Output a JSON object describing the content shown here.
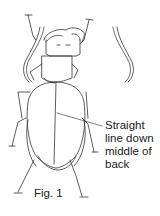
{
  "figure": {
    "caption": "Fig. 1",
    "annotation": {
      "lines": [
        "Straight",
        "line down",
        "middle of",
        "back"
      ],
      "pointer_target": "elytral-suture"
    },
    "colors": {
      "line": "#333333",
      "background": "#ffffff"
    }
  }
}
